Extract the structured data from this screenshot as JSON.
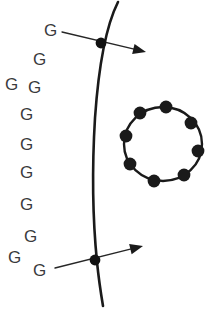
{
  "figure": {
    "background_color": "#ffffff",
    "ink_color": "#1a1a1a",
    "label_color": "#3a3a3c",
    "width": 216,
    "height": 313
  },
  "labels": {
    "glyph": "G",
    "count": 11,
    "items": [
      {
        "text": "G",
        "x": 44,
        "y": 22,
        "size": 17
      },
      {
        "text": "G",
        "x": 33,
        "y": 51,
        "size": 17
      },
      {
        "text": "G",
        "x": 5,
        "y": 76,
        "size": 17
      },
      {
        "text": "G",
        "x": 28,
        "y": 79,
        "size": 17
      },
      {
        "text": "G",
        "x": 20,
        "y": 106,
        "size": 17
      },
      {
        "text": "G",
        "x": 20,
        "y": 136,
        "size": 17
      },
      {
        "text": "G",
        "x": 20,
        "y": 164,
        "size": 17
      },
      {
        "text": "G",
        "x": 20,
        "y": 196,
        "size": 17
      },
      {
        "text": "G",
        "x": 24,
        "y": 228,
        "size": 17
      },
      {
        "text": "G",
        "x": 8,
        "y": 249,
        "size": 17
      },
      {
        "text": "G",
        "x": 33,
        "y": 262,
        "size": 17
      }
    ]
  },
  "filament": {
    "name": "vertical-curved-filament",
    "path": "M 118 2 C 108 22 99 60 95 118 C 92 168 93 222 97 262 C 99 282 101 294 103 306",
    "stroke_width": 2.6
  },
  "nodes": [
    {
      "name": "upper-node",
      "x": 101,
      "y": 43,
      "radius": 5.4
    },
    {
      "name": "lower-node",
      "x": 95,
      "y": 260,
      "radius": 5.4
    }
  ],
  "arrows": [
    {
      "name": "upper-arrow",
      "tail_x": 62,
      "tail_y": 32,
      "head_x": 146,
      "head_y": 52,
      "stroke_width": 1.3
    },
    {
      "name": "lower-arrow",
      "tail_x": 55,
      "tail_y": 268,
      "head_x": 143,
      "head_y": 246,
      "stroke_width": 1.3
    }
  ],
  "ring": {
    "name": "bead-ring",
    "center_x": 163,
    "center_y": 144,
    "radius_x": 39,
    "radius_y": 37,
    "bead_count": 8,
    "bead_radius": 6.4,
    "stroke_width": 2.4,
    "beads": [
      {
        "x": 166,
        "y": 107
      },
      {
        "x": 191,
        "y": 123
      },
      {
        "x": 198,
        "y": 151
      },
      {
        "x": 184,
        "y": 175
      },
      {
        "x": 154,
        "y": 181
      },
      {
        "x": 130,
        "y": 164
      },
      {
        "x": 126,
        "y": 136
      },
      {
        "x": 140,
        "y": 113
      }
    ]
  }
}
